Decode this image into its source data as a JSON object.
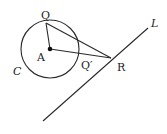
{
  "diagram": {
    "circle": {
      "name": "C",
      "center_label": "A",
      "cx": 50,
      "cy": 49,
      "r": 29
    },
    "points": {
      "A": {
        "label": "A",
        "x": 50,
        "y": 49
      },
      "Q": {
        "label": "Q",
        "x": 46,
        "y": 23
      },
      "Q_prime": {
        "label": "Q′",
        "x": 80,
        "y": 54
      },
      "R": {
        "label": "R",
        "x": 111,
        "y": 58
      }
    },
    "line": {
      "label": "L",
      "x1": 43,
      "y1": 121,
      "x2": 148,
      "y2": 28
    },
    "segments": [
      {
        "from": "A",
        "to": "Q"
      },
      {
        "from": "A",
        "to": "R"
      },
      {
        "from": "Q",
        "to": "R"
      }
    ],
    "labels": {
      "Q": "Q",
      "A": "A",
      "C": "C",
      "Q_prime": "Q′",
      "R": "R",
      "L": "L"
    },
    "colors": {
      "stroke": "#2a2a2a",
      "text": "#222222",
      "background": "#ffffff"
    }
  }
}
